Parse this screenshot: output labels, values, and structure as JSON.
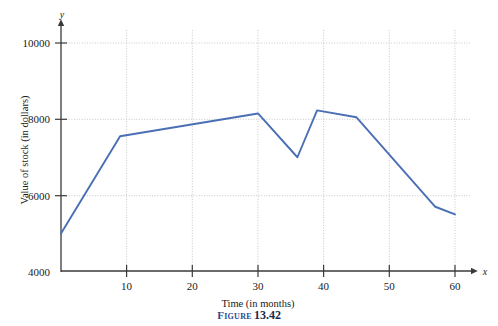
{
  "figure": {
    "caption_label": "Figure",
    "caption_number": "13.42"
  },
  "colors": {
    "line": "#4a6fb5",
    "axis": "#3a3a3a",
    "grid": "#c8c8c8",
    "caption_accent": "#2b4c8c",
    "background": "#ffffff"
  },
  "chart_data": {
    "type": "line",
    "title": "",
    "xlabel": "Time (in months)",
    "ylabel": "Value of stock (in dollars)",
    "x_axis_symbol": "x",
    "y_axis_symbol": "y",
    "xlim": [
      0,
      62
    ],
    "ylim": [
      4000,
      10400
    ],
    "xticks": [
      10,
      20,
      30,
      40,
      50,
      60
    ],
    "xtick_labels": [
      "10",
      "20",
      "30",
      "40",
      "50",
      "60"
    ],
    "yticks": [
      4000,
      6000,
      8000,
      10000
    ],
    "ytick_labels": [
      "4000",
      "6000",
      "8000",
      "10000"
    ],
    "grid": true,
    "grid_style": "dotted",
    "legend": "none",
    "series": [
      {
        "name": "Value of stock",
        "x": [
          0,
          9,
          30,
          36,
          39,
          45,
          57,
          60
        ],
        "values": [
          5000,
          7550,
          8150,
          7000,
          8230,
          8050,
          5700,
          5500
        ]
      }
    ]
  }
}
